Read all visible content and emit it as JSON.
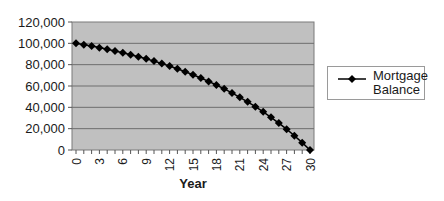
{
  "chart_data": {
    "type": "line",
    "title": "",
    "xlabel": "Year",
    "ylabel": "",
    "x": [
      0,
      1,
      2,
      3,
      4,
      5,
      6,
      7,
      8,
      9,
      10,
      11,
      12,
      13,
      14,
      15,
      16,
      17,
      18,
      19,
      20,
      21,
      22,
      23,
      24,
      25,
      26,
      27,
      28,
      29,
      30
    ],
    "series": [
      {
        "name": "Mortgage Balance",
        "values": [
          100000,
          98735,
          97395,
          95974,
          94468,
          92872,
          91180,
          89386,
          87485,
          85470,
          83334,
          81070,
          78670,
          76126,
          73430,
          70572,
          67543,
          64332,
          60928,
          57320,
          53496,
          49442,
          45145,
          40590,
          35762,
          30644,
          25219,
          19469,
          13374,
          6913,
          0
        ]
      }
    ],
    "x_ticks": [
      "0",
      "3",
      "6",
      "9",
      "12",
      "15",
      "18",
      "21",
      "24",
      "27",
      "30"
    ],
    "y_ticks": [
      "0",
      "20,000",
      "40,000",
      "60,000",
      "80,000",
      "100,000",
      "120,000"
    ],
    "ylim": [
      0,
      120000
    ],
    "xlim": [
      0,
      30
    ],
    "grid": true,
    "legend_position": "right",
    "plot_background": "#c0c0c0",
    "line_color": "#000000",
    "marker": "diamond"
  },
  "legend": {
    "label_line1": "Mortgage",
    "label_line2": "Balance"
  }
}
